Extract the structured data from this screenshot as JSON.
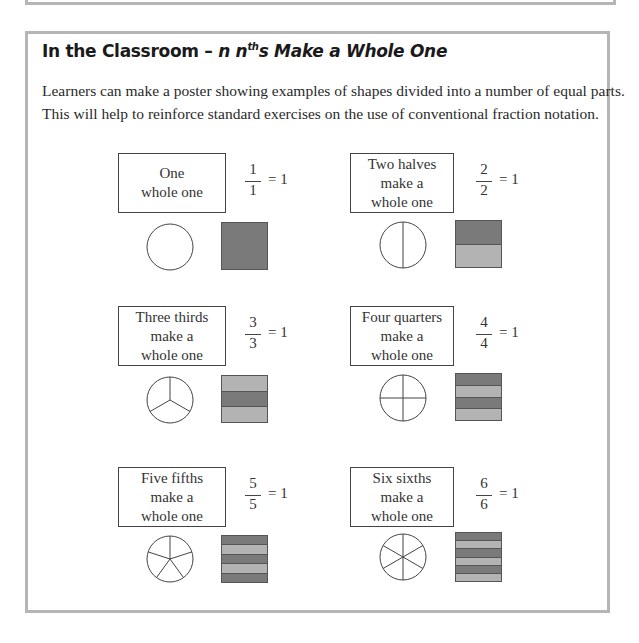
{
  "title": {
    "prefix": "In the Classroom – ",
    "italic_n": "n n",
    "sup": "th",
    "suffix": "s Make a Whole One"
  },
  "paragraph": [
    "Learners can make a poster showing examples of shapes divided into a number of equal parts.",
    "This will help to reinforce standard exercises on the use of conventional fraction notation."
  ],
  "colors": {
    "frame": "#b5b5b5",
    "dark_fill": "#7a7a7a",
    "light_fill": "#b3b3b3"
  },
  "examples": [
    {
      "lines": [
        "One",
        "whole one"
      ],
      "numerator": "1",
      "denominator": "1",
      "equals": "= 1",
      "parts": 1
    },
    {
      "lines": [
        "Two halves",
        "make a",
        "whole one"
      ],
      "numerator": "2",
      "denominator": "2",
      "equals": "= 1",
      "parts": 2
    },
    {
      "lines": [
        "Three thirds",
        "make a",
        "whole one"
      ],
      "numerator": "3",
      "denominator": "3",
      "equals": "= 1",
      "parts": 3
    },
    {
      "lines": [
        "Four quarters",
        "make a",
        "whole one"
      ],
      "numerator": "4",
      "denominator": "4",
      "equals": "= 1",
      "parts": 4
    },
    {
      "lines": [
        "Five fifths",
        "make a",
        "whole one"
      ],
      "numerator": "5",
      "denominator": "5",
      "equals": "= 1",
      "parts": 5
    },
    {
      "lines": [
        "Six sixths",
        "make a",
        "whole one"
      ],
      "numerator": "6",
      "denominator": "6",
      "equals": "= 1",
      "parts": 6
    }
  ]
}
